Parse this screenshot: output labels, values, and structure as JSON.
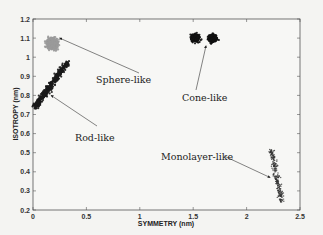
{
  "chart_data": {
    "type": "scatter",
    "title": "",
    "xlabel": "SYMMETRY (nm)",
    "ylabel": "ISOTROPY (nm)",
    "xlim": [
      0,
      2.5
    ],
    "ylim": [
      0.2,
      1.2
    ],
    "xticks": [
      "0",
      "0.5",
      "1",
      "1.5",
      "2",
      "2.5"
    ],
    "yticks": [
      "0.2",
      "0.3",
      "0.4",
      "0.5",
      "0.6",
      "0.7",
      "0.8",
      "0.9",
      "1",
      "1.1",
      "1.2"
    ],
    "grid": false,
    "legend": null,
    "series": [
      {
        "name": "Sphere-like",
        "color": "#9a9a9a",
        "center": [
          0.18,
          1.07
        ],
        "x_range": [
          0.08,
          0.26
        ],
        "y_range": [
          1.0,
          1.12
        ]
      },
      {
        "name": "Rod-like",
        "color": "#1a1a1a",
        "center": [
          0.15,
          0.86
        ],
        "x_range": [
          0.02,
          0.32
        ],
        "y_range": [
          0.74,
          0.97
        ]
      },
      {
        "name": "Cone-like",
        "color": "#111111",
        "center": [
          1.6,
          1.1
        ],
        "x_range": [
          1.45,
          1.8
        ],
        "y_range": [
          1.05,
          1.14
        ]
      },
      {
        "name": "Monolayer-like",
        "color": "#333333",
        "center": [
          2.28,
          0.37
        ],
        "x_range": [
          2.15,
          2.38
        ],
        "y_range": [
          0.2,
          0.52
        ]
      }
    ],
    "annotations": [
      {
        "text": "Sphere-like",
        "arrow_to": [
          0.25,
          1.1
        ]
      },
      {
        "text": "Rod-like",
        "arrow_to": [
          0.17,
          0.8
        ]
      },
      {
        "text": "Cone-like",
        "arrow_to": [
          1.62,
          1.06
        ]
      },
      {
        "text": "Monolayer-like",
        "arrow_to": [
          2.22,
          0.37
        ]
      }
    ]
  }
}
